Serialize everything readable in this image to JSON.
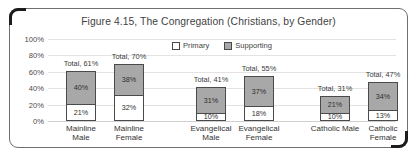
{
  "figure": {
    "title": "Figure 4.15, The Congregation (Christians, by Gender)"
  },
  "legend": {
    "primary_label": "Primary",
    "supporting_label": "Supporting"
  },
  "axis": {
    "yticks": [
      "100%",
      "80%",
      "60%",
      "40%",
      "20%",
      "0%"
    ]
  },
  "chart_data": {
    "type": "bar",
    "title": "Figure 4.15, The Congregation (Christians, by Gender)",
    "xlabel": "",
    "ylabel": "",
    "ylim": [
      0,
      100
    ],
    "ytick_values": [
      0,
      20,
      40,
      60,
      80,
      100
    ],
    "ytick_labels": [
      "0%",
      "20%",
      "40%",
      "60%",
      "80%",
      "100%"
    ],
    "grid": true,
    "stacked": true,
    "legend_position": "top-center",
    "categories": [
      "Mainline Male",
      "Mainline Female",
      "Evangelical Male",
      "Evangelical Female",
      "Catholic Male",
      "Catholic Female"
    ],
    "series": [
      {
        "name": "Primary",
        "color": "#ffffff",
        "values": [
          21,
          32,
          10,
          18,
          10,
          13
        ]
      },
      {
        "name": "Supporting",
        "color": "#a8a8a8",
        "values": [
          40,
          38,
          31,
          37,
          21,
          34
        ]
      }
    ],
    "totals": [
      61,
      70,
      41,
      55,
      31,
      47
    ],
    "bars": [
      {
        "category_lines": [
          "Mainline",
          "Male"
        ],
        "primary": 21,
        "supporting": 40,
        "total": 61,
        "primary_label": "21%",
        "supporting_label": "40%",
        "total_label": "Total, 61%"
      },
      {
        "category_lines": [
          "Mainline",
          "Female"
        ],
        "primary": 32,
        "supporting": 38,
        "total": 70,
        "primary_label": "32%",
        "supporting_label": "38%",
        "total_label": "Total, 70%"
      },
      {
        "category_lines": [
          "Evangelical",
          "Male"
        ],
        "primary": 10,
        "supporting": 31,
        "total": 41,
        "primary_label": "10%",
        "supporting_label": "31%",
        "total_label": "Total, 41%"
      },
      {
        "category_lines": [
          "Evangelical",
          "Female"
        ],
        "primary": 18,
        "supporting": 37,
        "total": 55,
        "primary_label": "18%",
        "supporting_label": "37%",
        "total_label": "Total, 55%"
      },
      {
        "category_lines": [
          "Catholic Male"
        ],
        "primary": 10,
        "supporting": 21,
        "total": 31,
        "primary_label": "10%",
        "supporting_label": "21%",
        "total_label": "Total, 31%"
      },
      {
        "category_lines": [
          "Catholic",
          "Female"
        ],
        "primary": 13,
        "supporting": 34,
        "total": 47,
        "primary_label": "13%",
        "supporting_label": "34%",
        "total_label": "Total, 47%"
      }
    ]
  }
}
